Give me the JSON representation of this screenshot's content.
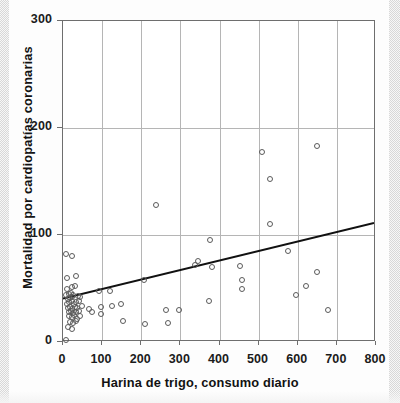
{
  "chart_data": {
    "type": "scatter",
    "title": "",
    "xlabel": "Harina de trigo, consumo diario",
    "ylabel": "Mortalidad por cardiopatías coronarias",
    "xlim": [
      0,
      800
    ],
    "ylim": [
      0,
      300
    ],
    "xticks": [
      0,
      100,
      200,
      300,
      400,
      500,
      600,
      700,
      800
    ],
    "yticks": [
      0,
      100,
      200,
      300
    ],
    "xticklabels": [
      "0",
      "100",
      "200",
      "300",
      "400",
      "500",
      "600",
      "700",
      "800"
    ],
    "yticklabels": [
      "0",
      "100",
      "200",
      "300"
    ],
    "grid": true,
    "grid_axis": "both",
    "legend": "none",
    "marker": "open-circle",
    "marker_color": "#5a5a5a",
    "points": [
      [
        8,
        82
      ],
      [
        22,
        80
      ],
      [
        10,
        60
      ],
      [
        34,
        62
      ],
      [
        10,
        50
      ],
      [
        22,
        51
      ],
      [
        30,
        52
      ],
      [
        8,
        44
      ],
      [
        14,
        45
      ],
      [
        20,
        46
      ],
      [
        26,
        44
      ],
      [
        12,
        40
      ],
      [
        18,
        41
      ],
      [
        24,
        42
      ],
      [
        38,
        43
      ],
      [
        44,
        42
      ],
      [
        10,
        36
      ],
      [
        16,
        37
      ],
      [
        22,
        38
      ],
      [
        28,
        36
      ],
      [
        34,
        37
      ],
      [
        42,
        38
      ],
      [
        12,
        32
      ],
      [
        18,
        33
      ],
      [
        24,
        31
      ],
      [
        30,
        33
      ],
      [
        36,
        32
      ],
      [
        48,
        34
      ],
      [
        14,
        28
      ],
      [
        20,
        29
      ],
      [
        26,
        27
      ],
      [
        32,
        28
      ],
      [
        40,
        29
      ],
      [
        16,
        24
      ],
      [
        22,
        23
      ],
      [
        28,
        25
      ],
      [
        36,
        22
      ],
      [
        44,
        24
      ],
      [
        18,
        19
      ],
      [
        26,
        18
      ],
      [
        34,
        20
      ],
      [
        12,
        14
      ],
      [
        24,
        12
      ],
      [
        8,
        2
      ],
      [
        66,
        31
      ],
      [
        74,
        28
      ],
      [
        92,
        48
      ],
      [
        98,
        33
      ],
      [
        96,
        26
      ],
      [
        120,
        48
      ],
      [
        126,
        34
      ],
      [
        148,
        36
      ],
      [
        152,
        20
      ],
      [
        206,
        58
      ],
      [
        210,
        17
      ],
      [
        238,
        128
      ],
      [
        262,
        30
      ],
      [
        268,
        18
      ],
      [
        296,
        30
      ],
      [
        338,
        72
      ],
      [
        346,
        76
      ],
      [
        376,
        95
      ],
      [
        380,
        70
      ],
      [
        374,
        38
      ],
      [
        452,
        71
      ],
      [
        458,
        58
      ],
      [
        458,
        50
      ],
      [
        508,
        178
      ],
      [
        530,
        152
      ],
      [
        530,
        110
      ],
      [
        576,
        85
      ],
      [
        596,
        44
      ],
      [
        620,
        52
      ],
      [
        648,
        65
      ],
      [
        650,
        183
      ],
      [
        676,
        30
      ]
    ],
    "trendline": {
      "type": "linear",
      "x_start": 0,
      "y_start": 39,
      "x_end": 800,
      "y_end": 110,
      "color": "#111111",
      "width": 2
    }
  }
}
